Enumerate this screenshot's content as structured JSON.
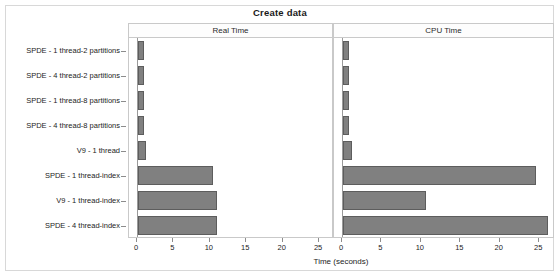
{
  "chart_data": {
    "type": "bar",
    "title": "Create data",
    "xlabel": "Time (seconds)",
    "ylabel": "",
    "orientation": "horizontal",
    "xlim": [
      0,
      26.5
    ],
    "xticks": [
      0,
      5,
      10,
      15,
      20,
      25
    ],
    "xticklabels": [
      "0",
      "5",
      "10",
      "15",
      "20",
      "25"
    ],
    "grid": false,
    "legend": "none",
    "panels": [
      {
        "label": "Real Time"
      },
      {
        "label": "CPU Time"
      }
    ],
    "categories": [
      "SPDE - 1 thread-2 partitions",
      "SPDE - 4 thread-2 partitions",
      "SPDE - 1 thread-8 partitions",
      "SPDE - 4 thread-8 partitions",
      "V9 - 1 thread",
      "SPDE - 1 thread-index",
      "V9 - 1 thread-index",
      "SPDE - 4 thread-index"
    ],
    "series": [
      {
        "name": "Real Time",
        "values": [
          0.85,
          0.8,
          0.85,
          0.8,
          1.05,
          10.3,
          10.8,
          10.9
        ]
      },
      {
        "name": "CPU Time",
        "values": [
          0.75,
          0.75,
          0.75,
          0.75,
          1.1,
          24.5,
          10.5,
          26.0
        ]
      }
    ],
    "bar_color": "#808080",
    "bar_edge_color": "#5d5d5d"
  }
}
